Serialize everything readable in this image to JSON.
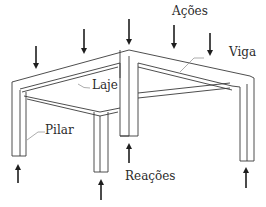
{
  "diagram": {
    "title": "",
    "labels": {
      "acoes": "Ações",
      "viga": "Viga",
      "laje": "Laje",
      "pilar": "Pilar",
      "reacoes": "Reações"
    },
    "colors": {
      "line": "#3a3a3a",
      "arrow": "#1e1e1e",
      "text": "#2b2b2b",
      "background": "#ffffff"
    },
    "load_arrows": [
      {
        "x": 36,
        "y1": 46,
        "y2": 68,
        "direction": "down"
      },
      {
        "x": 84,
        "y1": 29,
        "y2": 53,
        "direction": "down"
      },
      {
        "x": 129,
        "y1": 19,
        "y2": 44,
        "direction": "down"
      },
      {
        "x": 174,
        "y1": 25,
        "y2": 48,
        "direction": "down"
      },
      {
        "x": 210,
        "y1": 33,
        "y2": 55,
        "direction": "down"
      }
    ],
    "reaction_arrows": [
      {
        "x": 18,
        "y1": 183,
        "y2": 165,
        "direction": "up"
      },
      {
        "x": 101,
        "y1": 200,
        "y2": 180,
        "direction": "up"
      },
      {
        "x": 129,
        "y1": 163,
        "y2": 144,
        "direction": "up"
      },
      {
        "x": 246,
        "y1": 188,
        "y2": 168,
        "direction": "up"
      }
    ]
  }
}
